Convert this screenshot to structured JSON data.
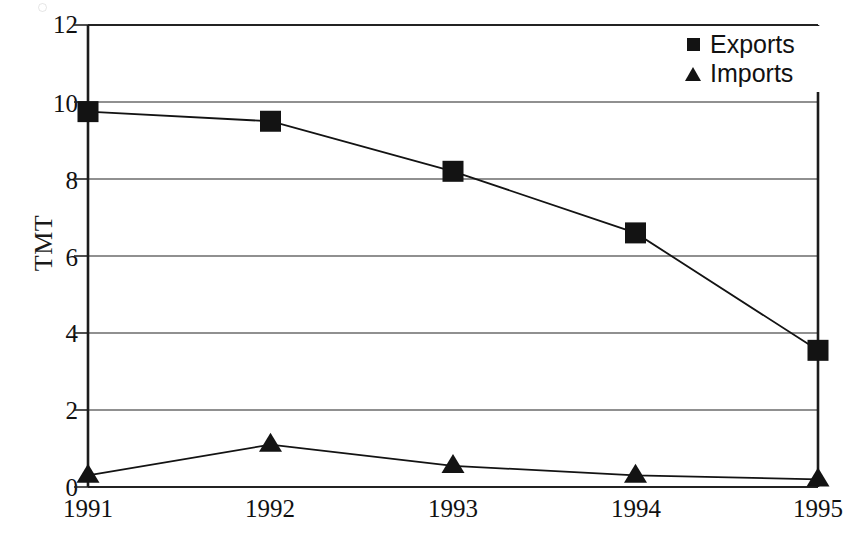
{
  "chart_data": {
    "type": "line",
    "title": "",
    "xlabel": "",
    "ylabel": "TMT",
    "categories": [
      "1991",
      "1992",
      "1993",
      "1994",
      "1995"
    ],
    "ylim": [
      0,
      12
    ],
    "yticks": [
      0,
      2,
      4,
      6,
      8,
      10,
      12
    ],
    "grid": "horizontal",
    "legend_position": "top-right",
    "series": [
      {
        "name": "Exports",
        "marker": "square",
        "color": "#131313",
        "values": [
          9.75,
          9.5,
          8.2,
          6.6,
          3.55
        ]
      },
      {
        "name": "Imports",
        "marker": "triangle",
        "color": "#131313",
        "values": [
          0.3,
          1.1,
          0.55,
          0.3,
          0.2
        ]
      }
    ]
  },
  "axes": {
    "y_title": "TMT",
    "y_tick_labels": [
      "12",
      "10",
      "8",
      "6",
      "4",
      "2",
      "0"
    ],
    "x_tick_labels": [
      "1991",
      "1992",
      "1993",
      "1994",
      "1995"
    ]
  },
  "legend": {
    "items": [
      {
        "label": "Exports",
        "marker": "square-marker-icon"
      },
      {
        "label": "Imports",
        "marker": "triangle-marker-icon"
      }
    ]
  }
}
